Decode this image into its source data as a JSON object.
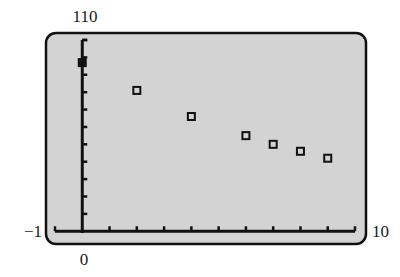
{
  "chart_data": {
    "type": "scatter",
    "title": "",
    "xlabel": "",
    "ylabel": "",
    "window": {
      "xmin": -1,
      "xmax": 10,
      "ymin": -1,
      "ymax": 110,
      "xscl": 1,
      "yscl": 10
    },
    "xlim": [
      -1,
      10
    ],
    "ylim": [
      -1,
      110
    ],
    "grid": false,
    "legend": null,
    "tick_labels": {
      "ymax": "110",
      "ymin": "−1",
      "xmin": "0",
      "xmax": "10"
    },
    "series": [
      {
        "name": "data",
        "marker": "hollow-square",
        "x": [
          0,
          2,
          4,
          6,
          7,
          8,
          9
        ],
        "y": [
          97,
          81,
          66,
          55,
          50,
          46,
          42
        ]
      }
    ]
  },
  "colors": {
    "screen_bg": "#d3d3d3",
    "frame": "#111111",
    "axis": "#111111",
    "marker": "#111111"
  }
}
